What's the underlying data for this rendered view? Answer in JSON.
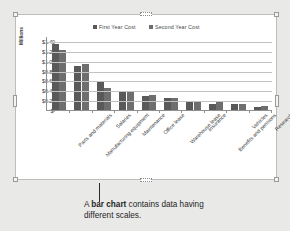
{
  "caption": {
    "prefix": "A ",
    "emphasis": "bar chart",
    "suffix": " contains data having different scales."
  },
  "chart_object": {
    "selected": true,
    "handle_name": "selection-handle"
  },
  "chart_data": {
    "type": "bar",
    "title": "",
    "subtitle": "",
    "xlabel": "",
    "ylabel": "Millions",
    "grid": true,
    "legend_position": "top-center",
    "ylim": [
      0,
      1.5
    ],
    "ytick_labels": [
      "$1.40",
      "$1.20",
      "$1.00",
      "$0.80",
      "$0.60",
      "$0.40",
      "$0.20",
      "$-"
    ],
    "ytick_values": [
      1.4,
      1.2,
      1.0,
      0.8,
      0.6,
      0.4,
      0.2,
      0
    ],
    "categories": [
      "Parts and materials",
      "Manufacturing equipment",
      "Salaries",
      "Maintenance",
      "Office lease",
      "Warehouse lease",
      "Insurance",
      "Benefits and pensions",
      "Vehicles",
      "Research"
    ],
    "series": [
      {
        "name": "First Year Cost",
        "color": "#595959",
        "values": [
          1.33,
          0.9,
          0.57,
          0.37,
          0.28,
          0.24,
          0.16,
          0.13,
          0.12,
          0.07
        ]
      },
      {
        "name": "Second Year Cost",
        "color": "#6e6e6e",
        "values": [
          1.22,
          0.93,
          0.44,
          0.38,
          0.3,
          0.25,
          0.17,
          0.17,
          0.12,
          0.08
        ]
      }
    ]
  }
}
